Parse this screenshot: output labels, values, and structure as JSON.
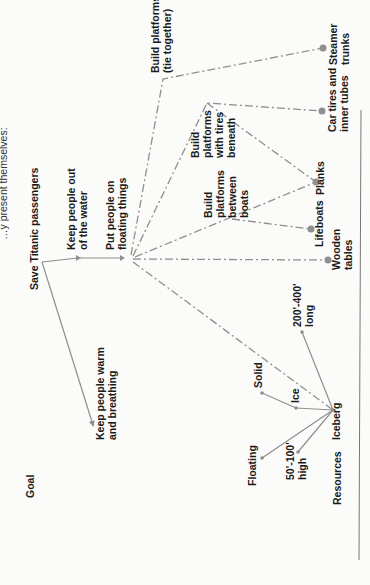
{
  "caption": "…y present themselves:",
  "rows": {
    "goal_label": "Goal",
    "resources_label": "Resources"
  },
  "goal": {
    "root": "Save Titanic passengers",
    "subgoals": [
      {
        "id": "keep-out-water",
        "lines": [
          "Keep people out",
          "of the water"
        ]
      },
      {
        "id": "keep-warm",
        "lines": [
          "Keep people warm",
          "and breathing"
        ]
      },
      {
        "id": "floating-things",
        "lines": [
          "Put people on",
          "floating things"
        ]
      }
    ]
  },
  "strategies": [
    {
      "id": "tie-together",
      "lines": [
        "Build platforms",
        "(tie together)"
      ]
    },
    {
      "id": "tires-beneath",
      "lines": [
        "Build",
        "platforms",
        "with tires",
        "beneath"
      ]
    },
    {
      "id": "between-boats",
      "lines": [
        "Build",
        "platforms",
        "between",
        "boats"
      ]
    }
  ],
  "resources": [
    {
      "id": "steamer-trunks",
      "lines": [
        "Steamer",
        "trunks"
      ]
    },
    {
      "id": "car-tires",
      "lines": [
        "Car tires and",
        "inner tubes"
      ]
    },
    {
      "id": "planks",
      "lines": [
        "Planks"
      ]
    },
    {
      "id": "lifeboats",
      "lines": [
        "Lifeboats"
      ]
    },
    {
      "id": "wooden-tables",
      "lines": [
        "Wooden",
        "tables"
      ]
    }
  ],
  "iceberg": {
    "label": "Iceberg",
    "attributes": [
      {
        "id": "length",
        "lines": [
          "200'-400'",
          "long"
        ]
      },
      {
        "id": "solid",
        "lines": [
          "Solid"
        ]
      },
      {
        "id": "ice",
        "lines": [
          "Ice"
        ]
      },
      {
        "id": "floating",
        "lines": [
          "Floating"
        ]
      },
      {
        "id": "height",
        "lines": [
          "50'-100'",
          "high"
        ]
      }
    ]
  },
  "colors": {
    "line": "#8f8f8f",
    "text": "#1a1a1a"
  }
}
